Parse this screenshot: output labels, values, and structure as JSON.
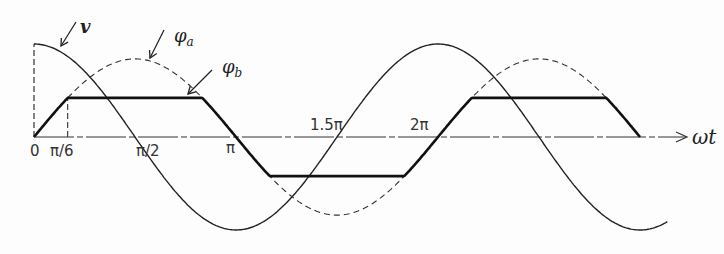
{
  "chart_data": {
    "type": "line",
    "title": "",
    "xlabel": "ωt",
    "ylabel": "",
    "xlim_radians": [
      0,
      3.2
    ],
    "x_ticks": [
      {
        "label": "0",
        "value": 0
      },
      {
        "label": "π/6",
        "value": 0.5236
      },
      {
        "label": "π/2",
        "value": 1.5708
      },
      {
        "label": "π",
        "value": 3.1416
      },
      {
        "label": "1.5π",
        "value": 4.7124
      },
      {
        "label": "2π",
        "value": 6.2832
      }
    ],
    "series": [
      {
        "name": "v",
        "label": "v",
        "function": "cos(ωt)",
        "amplitude": 1.0,
        "style": "solid-thin",
        "x_range": [
          0,
          9.9
        ]
      },
      {
        "name": "phi_a",
        "label": "φa",
        "function": "sin(ωt)",
        "amplitude": 0.84,
        "style": "dashed",
        "x_range": [
          0.5236,
          10.47
        ]
      },
      {
        "name": "phi_b",
        "label": "φb",
        "function": "clip(sin(ωt), ±0.5)",
        "amplitude": 0.84,
        "clip_fraction": 0.5,
        "style": "solid-thick",
        "x_range": [
          0,
          9.42
        ]
      }
    ],
    "annotations": [
      {
        "text": "v",
        "target": "v"
      },
      {
        "text": "φa",
        "target": "phi_a"
      },
      {
        "text": "φb",
        "target": "phi_b"
      }
    ]
  }
}
